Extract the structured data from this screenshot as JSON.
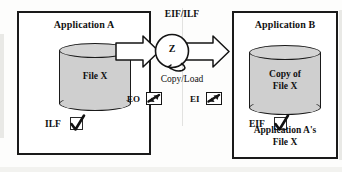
{
  "diagram": {
    "title_implicit": "EIF/ILF data transfer between Application A and Application B",
    "left_app": {
      "title": "Application A",
      "cylinder_label": "File X",
      "check_label": "ILF",
      "check_icon": "checkmark-icon",
      "box_border_color": "#1a1a1a",
      "cylinder_fill": "#cfcfcf"
    },
    "right_app": {
      "title": "Application B",
      "cylinder_label": "Copy of\nFile X",
      "cylinder_label_line1": "Copy of",
      "cylinder_label_line2": "File X",
      "check_label": "EIF",
      "check_icon": "checkmark-icon",
      "footer_line1": "Application A's",
      "footer_line2": "File X",
      "box_border_color": "#1a1a1a",
      "cylinder_fill": "#cfcfcf"
    },
    "center": {
      "top_label": "EIF/ILF",
      "process_label": "Z",
      "process_icon": "process-circle-icon",
      "mid_label": "Copy/Load",
      "left_arrow_icon": "block-arrow-right-icon",
      "right_arrow_icon": "block-arrow-right-icon",
      "io_items": [
        {
          "label": "EO",
          "icon": "transaction-arrow-icon"
        },
        {
          "label": "EI",
          "icon": "transaction-arrow-icon"
        }
      ]
    }
  }
}
